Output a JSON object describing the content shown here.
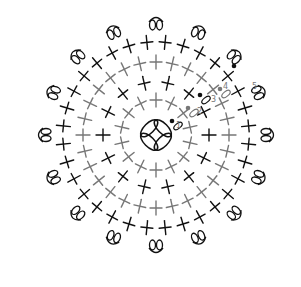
{
  "diagram": {
    "title": "",
    "type": "crochet-chart",
    "center": {
      "x": 156,
      "y": 135
    },
    "colors": {
      "black": "#111111",
      "gray": "#777777",
      "background": "#ffffff"
    },
    "center_ring": {
      "radius": 16,
      "chain_loops": 4,
      "color": "#111111"
    },
    "rounds": [
      {
        "number": "1",
        "radius": 35,
        "stitches": 14,
        "color": "#777777",
        "symbol": "single-crochet"
      },
      {
        "number": "2",
        "radius": 53,
        "stitches": 14,
        "color": "#111111",
        "symbol": "single-crochet"
      },
      {
        "number": "3",
        "radius": 73,
        "stitches": 28,
        "color": "#777777",
        "symbol": "single-crochet"
      },
      {
        "number": "4",
        "radius": 93,
        "stitches": 32,
        "color": "#111111",
        "symbol": "single-crochet"
      },
      {
        "number": "5",
        "radius": 111,
        "stitches": 16,
        "color": "#111111",
        "symbol": "picot-shell"
      }
    ],
    "round_labels": [
      {
        "text": "1",
        "x": 176,
        "y": 128
      },
      {
        "text": "2",
        "x": 197,
        "y": 114
      },
      {
        "text": "3",
        "x": 211,
        "y": 102
      },
      {
        "text": "4",
        "x": 223,
        "y": 89
      },
      {
        "text": "5",
        "x": 252,
        "y": 89
      }
    ],
    "start_markers": [
      {
        "x": 172,
        "y": 121,
        "color": "#111111"
      },
      {
        "x": 188,
        "y": 108,
        "color": "#777777"
      },
      {
        "x": 200,
        "y": 95,
        "color": "#111111"
      },
      {
        "x": 220,
        "y": 89,
        "color": "#777777"
      },
      {
        "x": 234,
        "y": 66,
        "color": "#111111"
      }
    ]
  }
}
